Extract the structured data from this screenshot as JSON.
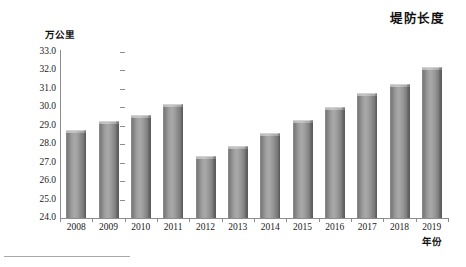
{
  "chart_data": {
    "type": "bar",
    "title": "堤防长度",
    "xlabel": "年份",
    "ylabel": "万公里",
    "categories": [
      "2008",
      "2009",
      "2010",
      "2011",
      "2012",
      "2013",
      "2014",
      "2015",
      "2016",
      "2017",
      "2018",
      "2019"
    ],
    "values": [
      28.6,
      29.1,
      29.4,
      30.0,
      27.2,
      27.75,
      28.45,
      29.15,
      29.85,
      30.6,
      31.1,
      32.0
    ],
    "ylim": [
      24.0,
      33.0
    ],
    "ytick_step": 1.0,
    "yticks": [
      "33.0",
      "32.0",
      "31.0",
      "30.0",
      "29.0",
      "28.0",
      "27.0",
      "26.0",
      "25.0",
      "24.0"
    ],
    "grid": false,
    "legend": null,
    "series": [
      {
        "name": "堤防长度",
        "values": [
          28.6,
          29.1,
          29.4,
          30.0,
          27.2,
          27.75,
          28.45,
          29.15,
          29.85,
          30.6,
          31.1,
          32.0
        ]
      }
    ],
    "colors": {
      "bar_fill": "#9a9a9a",
      "bar_edge": "#6f6f6f",
      "bar_top": "#c0c0c0",
      "axis": "#8c8c8c",
      "text": "#1a1a1a"
    }
  }
}
